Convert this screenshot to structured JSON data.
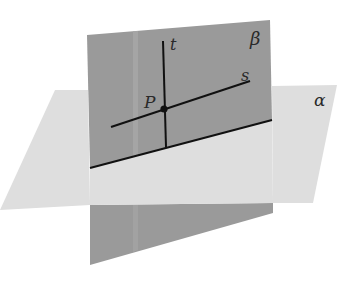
{
  "figure": {
    "colors": {
      "background": "#ffffff",
      "plane_beta": "#9a9a9a",
      "plane_beta_strip": "#a8a8a8",
      "plane_alpha": "#dedede",
      "line": "#111111",
      "label": "#2a2a2a"
    },
    "labels": {
      "plane_beta": "β",
      "plane_alpha": "α",
      "line_t": "t",
      "line_s": "s",
      "point_p": "P"
    }
  }
}
